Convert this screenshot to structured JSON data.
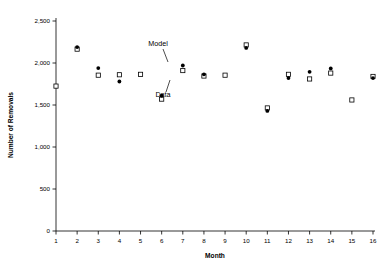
{
  "chart_data": {
    "type": "scatter",
    "title": "",
    "xlabel": "Month",
    "ylabel": "Number of Removals",
    "xlim": [
      1,
      16
    ],
    "ylim": [
      0,
      2500
    ],
    "grid": false,
    "legend_position": "inline-annotation",
    "x": [
      1,
      2,
      3,
      4,
      5,
      6,
      7,
      8,
      9,
      10,
      11,
      12,
      13,
      14,
      15,
      16
    ],
    "xticklabels": [
      "1",
      "2",
      "3",
      "4",
      "5",
      "6",
      "7",
      "8",
      "9",
      "10",
      "11",
      "12",
      "13",
      "14",
      "15",
      "16"
    ],
    "yticks": [
      0,
      500,
      1000,
      1500,
      2000,
      2500
    ],
    "yticklabels": [
      "0",
      "500",
      "1,000",
      "1,500",
      "2,000",
      "2,500"
    ],
    "series": [
      {
        "name": "Model",
        "marker": "filled-circle",
        "values": [
          null,
          2190,
          1940,
          1780,
          null,
          1610,
          1970,
          1865,
          null,
          2180,
          1430,
          1820,
          1895,
          1935,
          null,
          1820
        ]
      },
      {
        "name": "Data",
        "marker": "open-square",
        "values": [
          1725,
          2165,
          1855,
          1860,
          1865,
          1570,
          1910,
          1845,
          1855,
          2215,
          1465,
          1865,
          1810,
          1880,
          1560,
          1840
        ]
      }
    ],
    "annotations": [
      {
        "text": "Model",
        "text_x": 158,
        "text_y": 46,
        "leader": [
          [
            163,
            49
          ],
          [
            168,
            62
          ]
        ]
      },
      {
        "text": "Data",
        "text_x": 163,
        "text_y": 97,
        "leader": [
          [
            166,
            92
          ],
          [
            170,
            80
          ]
        ]
      }
    ]
  }
}
